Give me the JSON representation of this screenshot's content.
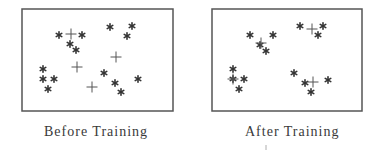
{
  "colors": {
    "background": "#ffffff",
    "stroke": "#555555",
    "point": "#333333",
    "text": "#3a3a3a"
  },
  "panels": [
    {
      "id": "before",
      "caption": "Before Training",
      "box": {
        "x": 22,
        "y": 9,
        "w": 151,
        "h": 102
      },
      "data_points_asterisk": [
        [
          59,
          35
        ],
        [
          82,
          35
        ],
        [
          70,
          44
        ],
        [
          76,
          50
        ],
        [
          110,
          27
        ],
        [
          132,
          26
        ],
        [
          127,
          36
        ],
        [
          43,
          69
        ],
        [
          43,
          79
        ],
        [
          54,
          79
        ],
        [
          48,
          89
        ],
        [
          104,
          73
        ],
        [
          115,
          83
        ],
        [
          121,
          92
        ],
        [
          138,
          79
        ]
      ],
      "centroids_plus": [
        [
          71,
          34
        ],
        [
          116,
          57
        ],
        [
          77,
          67
        ],
        [
          92,
          87
        ]
      ]
    },
    {
      "id": "after",
      "caption": "After Training",
      "box": {
        "x": 212,
        "y": 9,
        "w": 150,
        "h": 102
      },
      "data_points_asterisk": [
        [
          250,
          35
        ],
        [
          273,
          35
        ],
        [
          260,
          45
        ],
        [
          266,
          51
        ],
        [
          300,
          26
        ],
        [
          323,
          26
        ],
        [
          318,
          35
        ],
        [
          233,
          69
        ],
        [
          233,
          79
        ],
        [
          244,
          79
        ],
        [
          239,
          89
        ],
        [
          294,
          73
        ],
        [
          305,
          83
        ],
        [
          311,
          92
        ],
        [
          328,
          80
        ]
      ],
      "centroids_plus": [
        [
          261,
          43
        ],
        [
          312,
          29
        ],
        [
          233,
          79
        ],
        [
          313,
          82
        ]
      ]
    }
  ],
  "symbols": {
    "data_point": "asterisk-icon",
    "centroid": "plus-icon"
  }
}
